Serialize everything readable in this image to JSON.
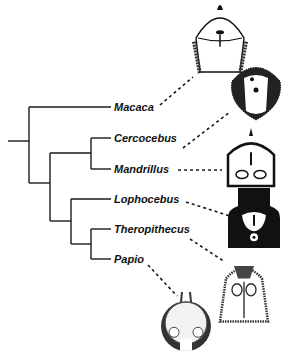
{
  "diagram": {
    "type": "phylogenetic-tree",
    "line_color": "#1a1a1a",
    "taxa": [
      {
        "name": "Macaca",
        "label_x": 114,
        "y": 107,
        "dash": [
          160,
          105,
          193,
          77
        ]
      },
      {
        "name": "Cercocebus",
        "label_x": 114,
        "y": 138,
        "dash": [
          183,
          148,
          230,
          112
        ]
      },
      {
        "name": "Mandrillus",
        "label_x": 114,
        "y": 169,
        "dash": [
          178,
          170,
          222,
          170
        ]
      },
      {
        "name": "Lophocebus",
        "label_x": 114,
        "y": 199,
        "dash": [
          186,
          202,
          230,
          216
        ]
      },
      {
        "name": "Theropithecus",
        "label_x": 114,
        "y": 229,
        "dash": [
          190,
          239,
          225,
          262
        ]
      },
      {
        "name": "Papio",
        "label_x": 114,
        "y": 259,
        "dash": [
          148,
          265,
          177,
          296
        ]
      }
    ],
    "illustrations": [
      {
        "taxon": "Macaca",
        "x": 190,
        "y": 2,
        "w": 60,
        "h": 72,
        "style": "pale"
      },
      {
        "taxon": "Cercocebus",
        "x": 228,
        "y": 60,
        "w": 56,
        "h": 60,
        "style": "dark-ring"
      },
      {
        "taxon": "Mandrillus",
        "x": 224,
        "y": 134,
        "w": 54,
        "h": 52,
        "style": "outline"
      },
      {
        "taxon": "Lophocebus",
        "x": 228,
        "y": 188,
        "w": 52,
        "h": 60,
        "style": "black"
      },
      {
        "taxon": "Theropithecus",
        "x": 218,
        "y": 262,
        "w": 52,
        "h": 66,
        "style": "hatched"
      },
      {
        "taxon": "Papio",
        "x": 160,
        "y": 292,
        "w": 52,
        "h": 62,
        "style": "round"
      }
    ]
  }
}
